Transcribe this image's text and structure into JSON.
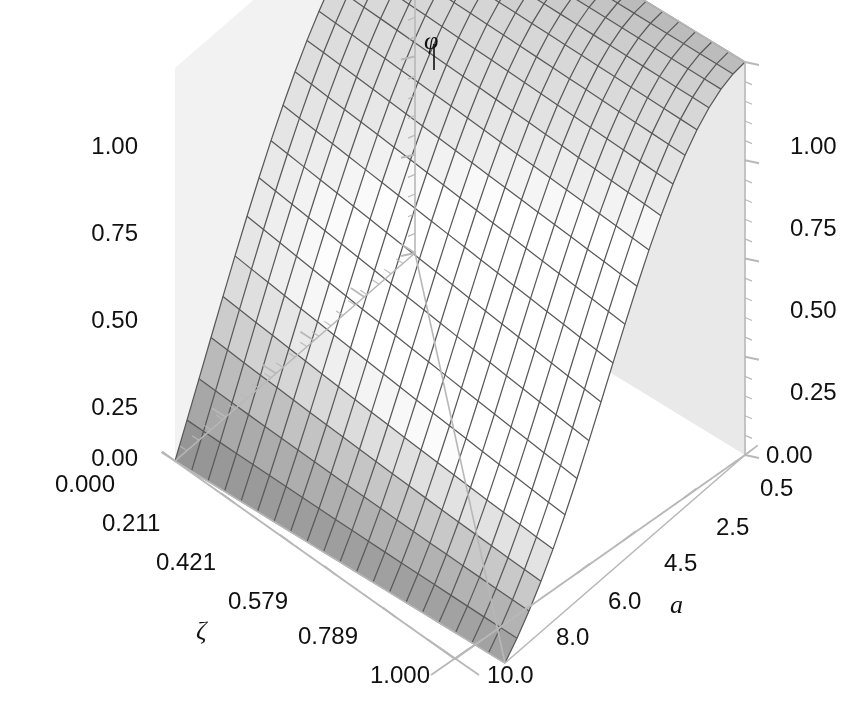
{
  "chart_data": {
    "type": "surface",
    "title": "",
    "zlabel": "φ",
    "xlabel": "ζ",
    "ylabel": "a",
    "zlim": [
      0.0,
      1.0
    ],
    "z_ticks_left": [
      "1.00",
      "0.75",
      "0.50",
      "0.25",
      "0.00"
    ],
    "z_ticks_right": [
      "1.00",
      "0.75",
      "0.50",
      "0.25",
      "0.00"
    ],
    "z_tick_values": [
      1.0,
      0.75,
      0.5,
      0.25,
      0.0
    ],
    "x_ticks": [
      "0.000",
      "0.211",
      "0.421",
      "0.579",
      "0.789",
      "1.000"
    ],
    "x_tick_values": [
      0.0,
      0.211,
      0.421,
      0.579,
      0.789,
      1.0
    ],
    "y_ticks": [
      "0.5",
      "2.5",
      "4.5",
      "6.0",
      "8.0",
      "10.0"
    ],
    "y_tick_values": [
      0.5,
      2.5,
      4.5,
      6.0,
      8.0,
      10.0
    ],
    "xlim": [
      0.0,
      1.0
    ],
    "ylim": [
      0.5,
      10.0
    ],
    "grid": true,
    "legend": "none",
    "mesh_n_x": 20,
    "mesh_n_y": 20,
    "colormap": "greyscale",
    "surface_description": "phi decreases monotonically from 1.0 at zeta=0 toward 0.0 at zeta=1; falloff sharpens as a increases",
    "series": [
      {
        "name": "a=0.5",
        "x": [
          0.0,
          0.105,
          0.211,
          0.316,
          0.421,
          0.5,
          0.579,
          0.684,
          0.789,
          0.895,
          1.0
        ],
        "z": [
          1.0,
          0.95,
          0.89,
          0.81,
          0.72,
          0.65,
          0.57,
          0.44,
          0.3,
          0.16,
          0.02
        ]
      },
      {
        "name": "a=2.5",
        "x": [
          0.0,
          0.105,
          0.211,
          0.316,
          0.421,
          0.5,
          0.579,
          0.684,
          0.789,
          0.895,
          1.0
        ],
        "z": [
          1.0,
          0.93,
          0.85,
          0.75,
          0.64,
          0.56,
          0.47,
          0.34,
          0.22,
          0.11,
          0.01
        ]
      },
      {
        "name": "a=4.5",
        "x": [
          0.0,
          0.105,
          0.211,
          0.316,
          0.421,
          0.5,
          0.579,
          0.684,
          0.789,
          0.895,
          1.0
        ],
        "z": [
          1.0,
          0.91,
          0.8,
          0.68,
          0.56,
          0.47,
          0.38,
          0.26,
          0.16,
          0.07,
          0.01
        ]
      },
      {
        "name": "a=6.0",
        "x": [
          0.0,
          0.105,
          0.211,
          0.316,
          0.421,
          0.5,
          0.579,
          0.684,
          0.789,
          0.895,
          1.0
        ],
        "z": [
          1.0,
          0.89,
          0.76,
          0.62,
          0.49,
          0.4,
          0.31,
          0.2,
          0.12,
          0.05,
          0.0
        ]
      },
      {
        "name": "a=8.0",
        "x": [
          0.0,
          0.105,
          0.211,
          0.316,
          0.421,
          0.5,
          0.579,
          0.684,
          0.789,
          0.895,
          1.0
        ],
        "z": [
          1.0,
          0.86,
          0.71,
          0.56,
          0.42,
          0.34,
          0.26,
          0.16,
          0.09,
          0.03,
          0.0
        ]
      },
      {
        "name": "a=10.0",
        "x": [
          0.0,
          0.105,
          0.211,
          0.316,
          0.421,
          0.5,
          0.579,
          0.684,
          0.789,
          0.895,
          1.0
        ],
        "z": [
          1.0,
          0.84,
          0.67,
          0.51,
          0.37,
          0.29,
          0.22,
          0.13,
          0.07,
          0.02,
          0.0
        ]
      }
    ],
    "colors": {
      "background": "#ffffff",
      "back_wall": "#e9e9e9",
      "mesh_line": "#595959",
      "axis_line": "#b8b8b8",
      "text": "#111111",
      "surface_light": "#ffffff",
      "surface_dark": "#6a6a6a"
    }
  },
  "axes": {
    "z_label": "φ",
    "x_label": "ζ",
    "y_label": "a",
    "left_ticks": [
      "1.00",
      "0.75",
      "0.50",
      "0.25",
      "0.00"
    ],
    "right_ticks": [
      "1.00",
      "0.75",
      "0.50",
      "0.25",
      "0.00"
    ],
    "zeta_ticks": [
      "0.000",
      "0.211",
      "0.421",
      "0.579",
      "0.789",
      "1.000"
    ],
    "a_ticks": [
      "0.5",
      "2.5",
      "4.5",
      "6.0",
      "8.0",
      "10.0"
    ]
  }
}
